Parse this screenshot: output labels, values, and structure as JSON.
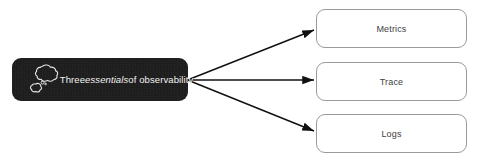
{
  "canvas": {
    "width": 478,
    "height": 160,
    "background": "#ffffff"
  },
  "diagram": {
    "type": "fan-out-concept-map",
    "root": {
      "label_prefix": "Three ",
      "label_emphasis": "essentials",
      "label_suffix": " of observability",
      "label_full": "Three essentials of observability",
      "icon": "thought-bubble-icon",
      "fill": "#1c1c1c",
      "text_color": "#f2f2f2"
    },
    "leaves": [
      {
        "label": "Metrics",
        "border": "#9a9a9a",
        "fill": "#ffffff",
        "text_color": "#414141"
      },
      {
        "label": "Trace",
        "border": "#9a9a9a",
        "fill": "#ffffff",
        "text_color": "#414141"
      },
      {
        "label": "Logs",
        "border": "#9a9a9a",
        "fill": "#ffffff",
        "text_color": "#414141"
      }
    ],
    "connectors": [
      {
        "from": "root",
        "to": "Metrics",
        "arrow_start": true,
        "arrow_end": true,
        "color": "#101010"
      },
      {
        "from": "root",
        "to": "Trace",
        "arrow_start": true,
        "arrow_end": true,
        "color": "#101010"
      },
      {
        "from": "root",
        "to": "Logs",
        "arrow_start": true,
        "arrow_end": true,
        "color": "#101010"
      }
    ]
  }
}
